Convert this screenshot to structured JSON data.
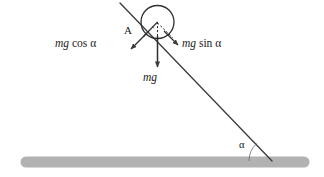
{
  "figure": {
    "width": 324,
    "height": 177,
    "background": "#ffffff",
    "stroke_color": "#3a3a3a",
    "ground_color": "#b0b0b0"
  },
  "labels": {
    "point_a": "A",
    "mg_cos_alpha": {
      "var": "mg",
      "fn": "cos",
      "greek": "α",
      "full": "mg cos α"
    },
    "mg_sin_alpha": {
      "var": "mg",
      "fn": "sin",
      "greek": "α",
      "full": "mg sin α"
    },
    "mg": {
      "var": "mg",
      "full": "mg"
    },
    "alpha_incline": "α"
  },
  "elements": {
    "ground_bar": "ground-bar",
    "incline_line": "incline-line",
    "ball_circle": "ball-circle",
    "radius_line": "radius-line",
    "vertical_dashed_line": "vertical-dashed-line",
    "normal_dashed_line": "normal-dashed-line",
    "arrow_mg_cos_alpha": "arrow-mg-cos-alpha",
    "arrow_mg_sin_alpha": "arrow-mg-sin-alpha",
    "arrow_mg": "arrow-mg",
    "angle_arc_incline": "angle-arc-incline"
  }
}
